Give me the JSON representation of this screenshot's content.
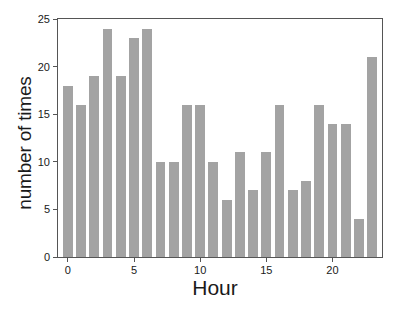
{
  "chart_data": {
    "type": "bar",
    "title": "",
    "subtitle": "",
    "xlabel": "Hour",
    "ylabel": "number of times",
    "categories": [
      0,
      1,
      2,
      3,
      4,
      5,
      6,
      7,
      8,
      9,
      10,
      11,
      12,
      13,
      14,
      15,
      16,
      17,
      18,
      19,
      20,
      21,
      22,
      23
    ],
    "values": [
      18,
      16,
      19,
      24,
      19,
      23,
      24,
      10,
      10,
      16,
      16,
      10,
      6,
      11,
      7,
      11,
      16,
      7,
      8,
      16,
      14,
      14,
      4,
      21
    ],
    "series": [
      {
        "name": "number of times",
        "values": [
          18,
          16,
          19,
          24,
          19,
          23,
          24,
          10,
          10,
          16,
          16,
          10,
          6,
          11,
          7,
          11,
          16,
          7,
          8,
          16,
          14,
          14,
          4,
          21
        ]
      }
    ],
    "xlim": [
      -0.75,
      23.75
    ],
    "ylim": [
      0,
      25
    ],
    "xticks": [
      0,
      5,
      10,
      15,
      20
    ],
    "xtick_labels": [
      "0",
      "5",
      "10",
      "15",
      "20"
    ],
    "yticks": [
      0,
      5,
      10,
      15,
      20,
      25
    ],
    "ytick_labels": [
      "0",
      "5",
      "10",
      "15",
      "20",
      "25"
    ],
    "grid": false,
    "legend": false,
    "legend_position": "none",
    "bar_color": "#a3a3a3",
    "axis_color": "#555555",
    "text_color": "#1a1a1a",
    "background_color": "#ffffff"
  }
}
